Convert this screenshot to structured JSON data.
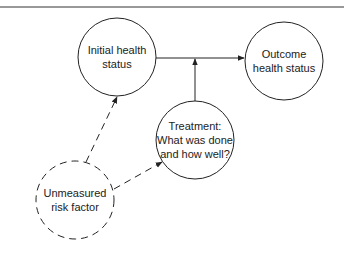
{
  "diagram": {
    "type": "causal-diagram",
    "nodes": [
      {
        "id": "initial",
        "lines": [
          "Initial health",
          "status"
        ],
        "style": "solid"
      },
      {
        "id": "outcome",
        "lines": [
          "Outcome",
          "health status"
        ],
        "style": "solid"
      },
      {
        "id": "treatment",
        "lines": [
          "Treatment:",
          "What was done",
          "and how well?"
        ],
        "style": "solid"
      },
      {
        "id": "unmeasured",
        "lines": [
          "Unmeasured",
          "risk factor"
        ],
        "style": "dashed"
      }
    ],
    "edges": [
      {
        "from": "initial",
        "to": "outcome",
        "style": "solid"
      },
      {
        "from": "treatment",
        "to": "initial-outcome-edge",
        "style": "solid"
      },
      {
        "from": "unmeasured",
        "to": "initial",
        "style": "dashed"
      },
      {
        "from": "unmeasured",
        "to": "treatment",
        "style": "dashed"
      }
    ],
    "colors": {
      "stroke": "#222222",
      "background": "#ffffff"
    }
  }
}
